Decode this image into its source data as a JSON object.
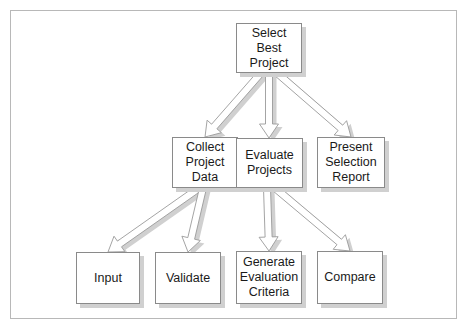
{
  "diagram": {
    "type": "hierarchy",
    "colors": {
      "box_border": "#8a8a8a",
      "box_fill": "#ffffff",
      "shadow": "#d0d0d0",
      "arrow_outline": "#9a9a9a",
      "frame_border": "#b8b8b8"
    },
    "nodes": {
      "root": {
        "label": "Select\nBest\nProject"
      },
      "collect": {
        "label": "Collect\nProject\nData"
      },
      "evaluate": {
        "label": "Evaluate\nProjects"
      },
      "present": {
        "label": "Present\nSelection\nReport"
      },
      "input": {
        "label": "Input"
      },
      "validate": {
        "label": "Validate"
      },
      "generate": {
        "label": "Generate\nEvaluation\nCriteria"
      },
      "compare": {
        "label": "Compare"
      }
    },
    "edges": [
      {
        "from": "root",
        "to": "collect"
      },
      {
        "from": "root",
        "to": "evaluate"
      },
      {
        "from": "root",
        "to": "present"
      },
      {
        "from": "collect",
        "to": "input"
      },
      {
        "from": "collect",
        "to": "validate"
      },
      {
        "from": "evaluate",
        "to": "generate"
      },
      {
        "from": "evaluate",
        "to": "compare"
      }
    ]
  }
}
